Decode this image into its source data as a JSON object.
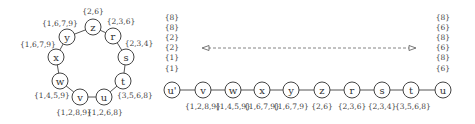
{
  "ring": {
    "nodes": [
      {
        "id": "z",
        "label": "z",
        "set": "{2,6}"
      },
      {
        "id": "r",
        "label": "r",
        "set": "{2,3,6}"
      },
      {
        "id": "s",
        "label": "s",
        "set": "{2,3,4}"
      },
      {
        "id": "t",
        "label": "t",
        "set": "{3,5,6,8}"
      },
      {
        "id": "u",
        "label": "u",
        "set": "{1,2,6,8}"
      },
      {
        "id": "v",
        "label": "v",
        "set": "{1,2,8,9}"
      },
      {
        "id": "w",
        "label": "w",
        "set": "{1,4,5,9}"
      },
      {
        "id": "x",
        "label": "x",
        "set": "{1,6,7,9}"
      },
      {
        "id": "y",
        "label": "y",
        "set": "{1,6,7,9}"
      }
    ]
  },
  "chain": {
    "nodes": [
      {
        "id": "u_prime",
        "label": "u'",
        "set": ""
      },
      {
        "id": "v",
        "label": "v",
        "set": "{1,2,8,9}"
      },
      {
        "id": "w",
        "label": "w",
        "set": "{1,4,5,9}"
      },
      {
        "id": "x",
        "label": "x",
        "set": "{1,6,7,9}"
      },
      {
        "id": "y",
        "label": "y",
        "set": "{1,6,7,9}"
      },
      {
        "id": "z",
        "label": "z",
        "set": "{2,6}"
      },
      {
        "id": "r",
        "label": "r",
        "set": "{2,3,6}"
      },
      {
        "id": "s",
        "label": "s",
        "set": "{2,3,4}"
      },
      {
        "id": "t",
        "label": "t",
        "set": "{3,5,6,8}"
      },
      {
        "id": "u",
        "label": "u",
        "set": ""
      }
    ],
    "left_stack": [
      "{8}",
      "{8}",
      "{2}",
      "{2}",
      "{1}",
      "{1}"
    ],
    "right_stack": [
      "{8}",
      "{6}",
      "{8}",
      "{6}",
      "{8}",
      "{6}"
    ]
  }
}
